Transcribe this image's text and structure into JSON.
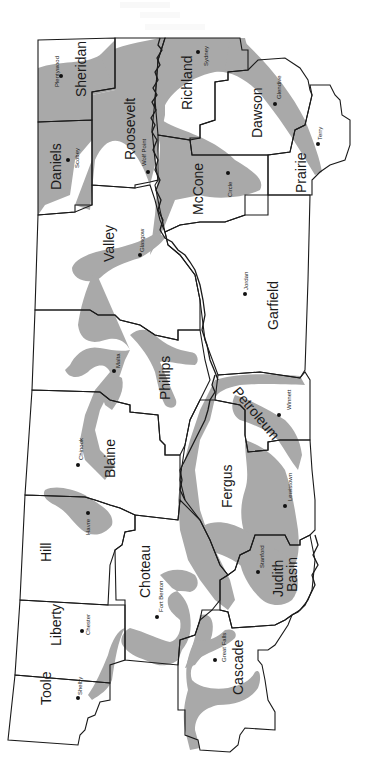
{
  "map": {
    "description": "Northeastern/central Montana counties (rotated 90 degrees) with shaded regions",
    "colors": {
      "shade": "#a9a9a9",
      "border": "#1a1a1a",
      "background": "#ffffff"
    },
    "counties": [
      {
        "name": "Sheridan"
      },
      {
        "name": "Roosevelt"
      },
      {
        "name": "Richland"
      },
      {
        "name": "Daniels"
      },
      {
        "name": "Dawson"
      },
      {
        "name": "Prairie"
      },
      {
        "name": "McCone"
      },
      {
        "name": "Valley"
      },
      {
        "name": "Garfield"
      },
      {
        "name": "Phillips"
      },
      {
        "name": "Petroleum"
      },
      {
        "name": "Blaine"
      },
      {
        "name": "Fergus"
      },
      {
        "name": "Hill"
      },
      {
        "name": "Choteau"
      },
      {
        "name": "Judith Basin"
      },
      {
        "name": "Liberty"
      },
      {
        "name": "Cascade"
      },
      {
        "name": "Toole"
      }
    ],
    "towns": [
      {
        "name": "Plentywood"
      },
      {
        "name": "Sydney"
      },
      {
        "name": "Glendive"
      },
      {
        "name": "Scobey"
      },
      {
        "name": "Wolf Point"
      },
      {
        "name": "Terry"
      },
      {
        "name": "Circle"
      },
      {
        "name": "Glasgow"
      },
      {
        "name": "Jordan"
      },
      {
        "name": "Malta"
      },
      {
        "name": "Winnett"
      },
      {
        "name": "Chinook"
      },
      {
        "name": "Lewistown"
      },
      {
        "name": "Havre"
      },
      {
        "name": "Stanford"
      },
      {
        "name": "Fort Benton"
      },
      {
        "name": "Chester"
      },
      {
        "name": "Great Falls"
      },
      {
        "name": "Shelby"
      }
    ]
  }
}
